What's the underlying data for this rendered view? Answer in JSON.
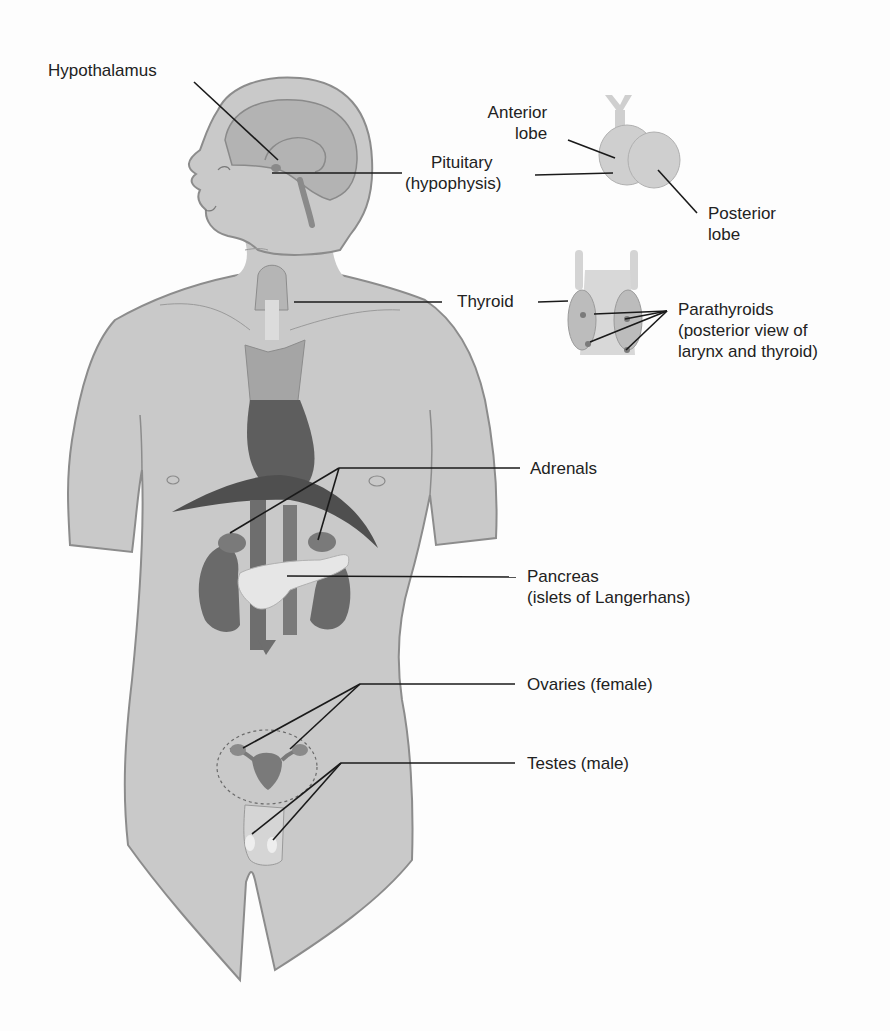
{
  "diagram": {
    "colors": {
      "background": "#fdfdfd",
      "body_fill": "#c9c9c9",
      "body_outline": "#8c8c8c",
      "organ_dark": "#6a6a6a",
      "organ_light": "#e6e6e6",
      "leader_line": "#1a1a1a",
      "text": "#222222"
    },
    "labels": {
      "hypothalamus": {
        "line1": "Hypothalamus"
      },
      "pituitary": {
        "line1": "Pituitary",
        "line2": "(hypophysis)"
      },
      "anterior_lobe": {
        "line1": "Anterior",
        "line2": "lobe"
      },
      "posterior_lobe": {
        "line1": "Posterior",
        "line2": "lobe"
      },
      "thyroid": {
        "line1": "Thyroid"
      },
      "parathyroids": {
        "line1": "Parathyroids",
        "line2": "(posterior view of",
        "line3": "larynx and thyroid)"
      },
      "adrenals": {
        "line1": "Adrenals"
      },
      "pancreas": {
        "line1": "Pancreas",
        "line2": "(islets of Langerhans)"
      },
      "ovaries": {
        "line1": "Ovaries (female)"
      },
      "testes": {
        "line1": "Testes (male)"
      }
    }
  }
}
